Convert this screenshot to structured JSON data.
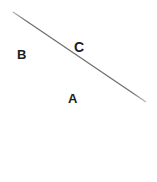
{
  "figure": {
    "background_color": "#ffffff",
    "width": 157,
    "height": 182
  },
  "chart_data": {
    "type": "diagram",
    "title": "",
    "xlabel": "",
    "ylabel": "",
    "grid": false,
    "legend": null,
    "lines": [
      {
        "name": "horizontal-axis",
        "label": "A",
        "x1": 10,
        "y1": 90,
        "x2": 144,
        "y2": 90,
        "color": "#8a8a8a",
        "width": 1.4
      },
      {
        "name": "vertical-axis",
        "label": "B",
        "x1": 31,
        "y1": 7,
        "x2": 31,
        "y2": 181,
        "color": "#8a8a8a",
        "width": 1.4
      },
      {
        "name": "diagonal-transversal",
        "label": "C",
        "x1": 13,
        "y1": 12,
        "x2": 146,
        "y2": 102,
        "color": "#6f6f6f",
        "width": 1.3
      }
    ],
    "annotations": [
      {
        "text": "A",
        "x": 73,
        "y": 99
      },
      {
        "text": "B",
        "x": 22,
        "y": 55
      },
      {
        "text": "C",
        "x": 79,
        "y": 47
      }
    ]
  },
  "labels": {
    "horizontal": "A",
    "vertical": "B",
    "diagonal": "C"
  },
  "colors": {
    "line_primary": "#8a8a8a",
    "line_diagonal": "#6f6f6f",
    "label_text": "#1c1c1c",
    "background": "#ffffff"
  }
}
